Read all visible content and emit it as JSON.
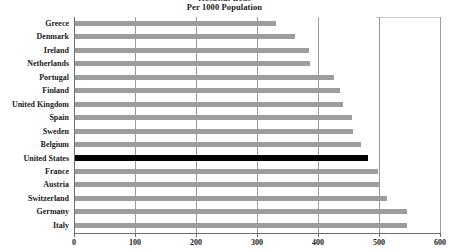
{
  "chart_data": {
    "type": "bar",
    "orientation": "horizontal",
    "title": "Per 1000 Population",
    "title_clipped_above": "Hospital Beds",
    "xlabel": "",
    "ylabel": "",
    "xlim": [
      0,
      600
    ],
    "xticks": [
      0,
      100,
      200,
      300,
      400,
      500,
      600
    ],
    "xtick_labels": [
      "0",
      "100",
      "200",
      "300",
      "400",
      "500",
      "600"
    ],
    "grid": true,
    "legend": "none",
    "categories": [
      "Greece",
      "Denmark",
      "Ireland",
      "Netherlands",
      "Portugal",
      "Finland",
      "United Kingdom",
      "Spain",
      "Sweden",
      "Belgium",
      "United States",
      "France",
      "Austria",
      "Switzerland",
      "Germany",
      "Italy"
    ],
    "values": [
      329,
      360,
      384,
      385,
      424,
      434,
      440,
      454,
      455,
      469,
      481,
      496,
      499,
      512,
      544,
      544
    ],
    "highlight_category": "United States",
    "colors": {
      "bar": "#9d9d9d",
      "highlight_bar": "#000000",
      "gridline": "#9a9a9a",
      "axis": "#6e6e6e",
      "text": "#1a1a1a",
      "background": "#ffffff"
    }
  }
}
